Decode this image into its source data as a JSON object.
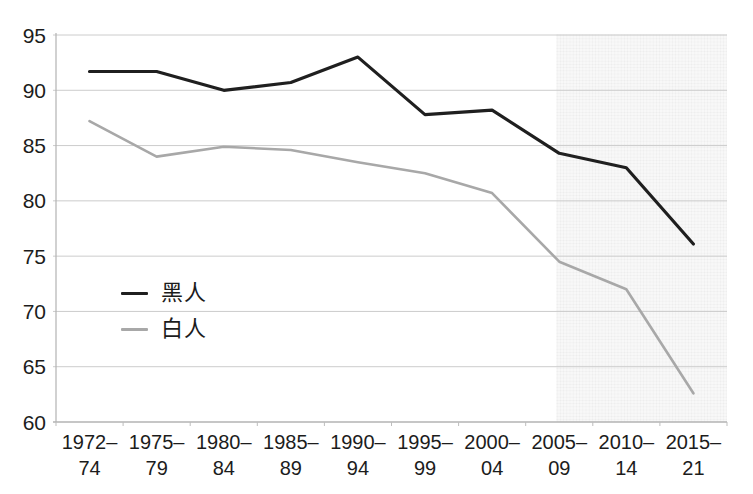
{
  "chart_data": {
    "type": "line",
    "title": "",
    "xlabel": "",
    "ylabel": "",
    "categories": [
      "1972–74",
      "1975–79",
      "1980–84",
      "1985–89",
      "1990–94",
      "1995–99",
      "2000–04",
      "2005–09",
      "2010–14",
      "2015–21"
    ],
    "series": [
      {
        "name": "黑人",
        "color": "#1f1f1f",
        "stroke_width": 3.2,
        "values": [
          91.7,
          91.7,
          90.0,
          90.7,
          93.0,
          87.8,
          88.2,
          84.3,
          83.0,
          76.1
        ]
      },
      {
        "name": "白人",
        "color": "#a8a8a8",
        "stroke_width": 2.6,
        "values": [
          87.2,
          84.0,
          84.9,
          84.6,
          83.5,
          82.5,
          80.7,
          74.5,
          72.0,
          62.6
        ]
      }
    ],
    "ylim": [
      60,
      95
    ],
    "yticks": [
      60,
      65,
      70,
      75,
      80,
      85,
      90,
      95
    ],
    "grid": "horizontal",
    "legend_position": "inside-left-middle",
    "shaded_region": {
      "from_category": "2005–09",
      "to_category": "2015–21",
      "extends_to": "right-edge"
    },
    "colors": {
      "gridline": "#cccccc",
      "axis": "#b3b3b3",
      "tick": "#bdbdbd",
      "label_text": "#1c1c1c",
      "shade_base": "rgba(125,125,125,0.055)",
      "shade_lines": "rgba(110,110,110,0.10)"
    }
  }
}
